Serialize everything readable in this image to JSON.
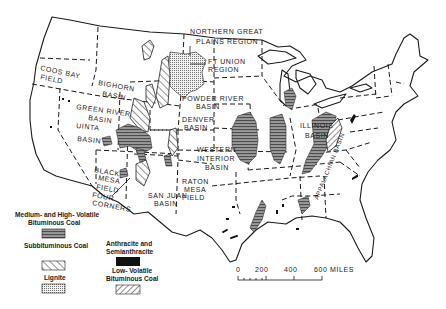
{
  "map": {
    "title": "Coal fields of the conterminous United States",
    "regions": [
      {
        "id": "northern-great-plains",
        "label_lines": [
          "NORTHERN GREAT",
          "PLAINS REGION"
        ]
      },
      {
        "id": "ft-union",
        "label_lines": [
          "FT UNION",
          "REGION"
        ]
      },
      {
        "id": "coos-bay",
        "label_lines": [
          "COOS BAY",
          "FIELD"
        ]
      },
      {
        "id": "bighorn",
        "label_lines": [
          "BIGHORN",
          "BASIN"
        ]
      },
      {
        "id": "powder-river",
        "label_lines": [
          "POWDER RIVER",
          "BASIN"
        ]
      },
      {
        "id": "green-river",
        "label_lines": [
          "GREEN RIVER",
          "BASIN"
        ]
      },
      {
        "id": "denver",
        "label_lines": [
          "DENVER",
          "BASIN"
        ]
      },
      {
        "id": "uinta",
        "label_lines": [
          "UINTA",
          "BASIN"
        ]
      },
      {
        "id": "western-interior",
        "label_lines": [
          "WESTERN",
          "INTERIOR",
          "BASIN"
        ]
      },
      {
        "id": "illinois",
        "label_lines": [
          "ILLINOIS",
          "BASIN"
        ]
      },
      {
        "id": "appalachian",
        "label_lines": [
          "APPALACHIAN BASIN"
        ]
      },
      {
        "id": "black-mesa",
        "label_lines": [
          "BLACK",
          "MESA",
          "FIELD"
        ]
      },
      {
        "id": "four-corners",
        "label_lines": [
          "FOUR",
          "CORNERS"
        ]
      },
      {
        "id": "san-juan",
        "label_lines": [
          "SAN JUAN",
          "BASIN"
        ]
      },
      {
        "id": "raton-mesa",
        "label_lines": [
          "RATON",
          "MESA",
          "FIELD"
        ]
      }
    ],
    "legend": {
      "items": [
        {
          "label_lines": [
            "Medium- and High- Volatile",
            "Bituminous Coal"
          ],
          "pattern": "horizontal-lines"
        },
        {
          "label_lines": [
            "Subbituminous Coal"
          ],
          "pattern": "diagonal-hatch"
        },
        {
          "label_lines": [
            "Lignite"
          ],
          "pattern": "stipple"
        },
        {
          "label_lines": [
            "Anthracite and",
            "Semianthracite"
          ],
          "pattern": "solid-black"
        },
        {
          "label_lines": [
            "Low- Volatile",
            "Bituminous Coal"
          ],
          "pattern": "back-diagonal-hatch"
        }
      ]
    },
    "scale_bar": {
      "ticks": [
        "0",
        "200",
        "400",
        "600 MILES"
      ]
    },
    "colors": {
      "ink": "#1a1a1a",
      "paper": "#ffffff",
      "fill_gray": "#8a8a8a"
    }
  }
}
